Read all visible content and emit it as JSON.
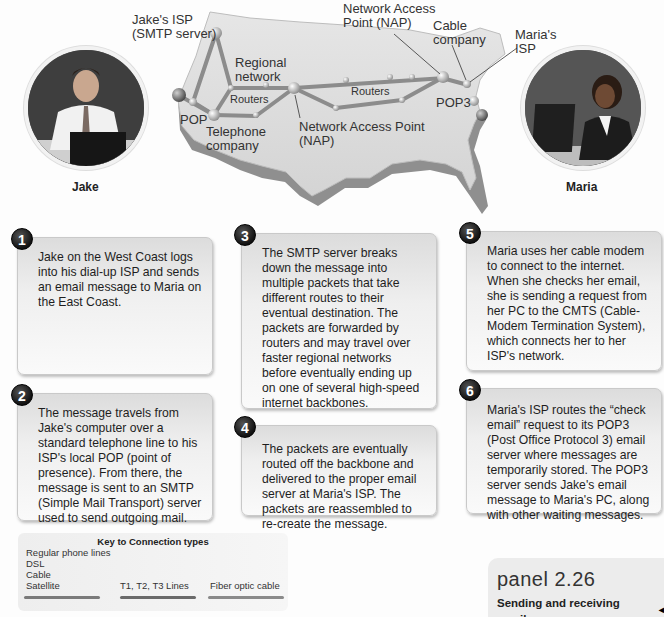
{
  "map": {
    "labels": {
      "jakes_isp": "Jake's ISP\n(SMTP server)",
      "regional_network": "Regional\nnetwork",
      "routers_west": "Routers",
      "pop": "POP",
      "telephone_company": "Telephone\ncompany",
      "nap_center": "Network Access Point\n(NAP)",
      "routers_east": "Routers",
      "nap_east": "Network Access\nPoint (NAP)",
      "cable_company": "Cable\ncompany",
      "marias_isp": "Maria's\nISP",
      "pop3": "POP3"
    }
  },
  "people": {
    "jake": {
      "name": "Jake",
      "icon": "person-at-laptop-photo"
    },
    "maria": {
      "name": "Maria",
      "icon": "person-at-laptop-photo"
    }
  },
  "steps": [
    {
      "number": "1",
      "text": "Jake on the West Coast logs into his dial-up ISP and sends an email message to Maria on the East Coast."
    },
    {
      "number": "2",
      "text": "The message travels from Jake's computer over a standard telephone line to his ISP's local POP (point of presence). From there, the message is sent to an SMTP (Simple Mail Transport) server used to send outgoing mail."
    },
    {
      "number": "3",
      "text": "The SMTP server breaks down the message into multiple packets that take different routes to their eventual destination. The packets are forwarded by routers and may travel over faster regional networks before eventually ending up on one of several high-speed internet backbones."
    },
    {
      "number": "4",
      "text": "The packets are eventually routed off the backbone and delivered to the proper email server at Maria's ISP. The packets are reassembled to re-create the message."
    },
    {
      "number": "5",
      "text": "Maria uses her cable modem to connect to the internet. When she checks her email, she is sending a request from her PC to the CMTS (Cable-Modem Termination System), which connects her to her ISP's network."
    },
    {
      "number": "6",
      "text": "Maria's ISP routes the “check email” request to its POP3 (Post Office Protocol 3) email server where messages are temporarily stored. The POP3 server sends Jake's email message to Maria's PC, along with other waiting messages."
    }
  ],
  "key": {
    "title": "Key to Connection types",
    "items": [
      {
        "label": "Regular phone lines"
      },
      {
        "label": "DSL"
      },
      {
        "label": "Cable"
      },
      {
        "label": "Satellite"
      },
      {
        "label": "T1, T2, T3 Lines"
      },
      {
        "label": "Fiber optic cable"
      }
    ],
    "line_colors": [
      "#7a7a7a",
      "#6a6a6a",
      "#8a8a8a"
    ]
  },
  "panel": {
    "title": "panel 2.26",
    "subtitle": "Sending and receiving emails"
  },
  "page_mark": "◂"
}
